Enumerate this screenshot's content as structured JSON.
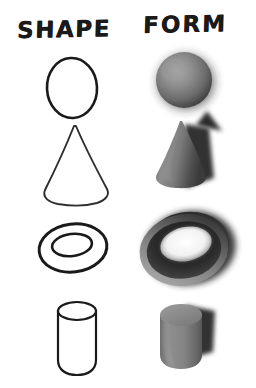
{
  "page": {
    "background_color": "#ffffff",
    "width": 256,
    "height": 388
  },
  "columns": [
    {
      "id": "shape",
      "label": "SHAPE",
      "description": "Two-dimensional flat outlines drawn in black line",
      "render_style": "outline",
      "stroke_color": "#1a1a1a",
      "fill_color": "#ffffff"
    },
    {
      "id": "form",
      "label": "FORM",
      "description": "Three-dimensional shaded solids with cast shadows",
      "render_style": "shaded",
      "light_color": "#b9b9b9",
      "mid_color": "#7d7d7d",
      "dark_color": "#2b2b2b",
      "shadow_color": "#333333"
    }
  ],
  "rows": [
    {
      "index": 1,
      "shape_name": "circle",
      "form_name": "sphere",
      "shape_label": "circle-outline",
      "form_label": "sphere-shaded"
    },
    {
      "index": 2,
      "shape_name": "triangle",
      "form_name": "cone",
      "shape_label": "cone-outline",
      "form_label": "cone-shaded"
    },
    {
      "index": 3,
      "shape_name": "ring",
      "form_name": "torus",
      "shape_label": "ring-outline",
      "form_label": "torus-shaded"
    },
    {
      "index": 4,
      "shape_name": "rectangle",
      "form_name": "cylinder",
      "shape_label": "cylinder-outline",
      "form_label": "cylinder-shaded"
    }
  ]
}
